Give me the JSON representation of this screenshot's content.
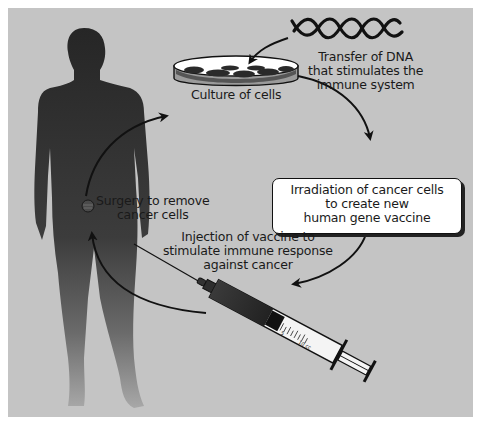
{
  "diagram": {
    "colors": {
      "background": "#c4c4c4",
      "silhouette": "#2e2e2e",
      "arrow": "#111111",
      "box_fill": "#ffffff"
    },
    "labels": {
      "dna": [
        "Transfer of DNA",
        "that stimulates the",
        "immune system"
      ],
      "culture": "Culture of cells",
      "irradiation": [
        "Irradiation of cancer cells",
        "to create new",
        "human gene vaccine"
      ],
      "injection": [
        "Injection of vaccine to",
        "stimulate immune response",
        "against cancer"
      ],
      "surgery": [
        "Surgery to remove",
        "cancer cells"
      ]
    },
    "syringe_scale": [
      "5",
      "10 cc"
    ],
    "steps": [
      "Surgery to remove cancer cells",
      "Culture of cells",
      "Transfer of DNA that stimulates the immune system",
      "Irradiation of cancer cells to create new human gene vaccine",
      "Injection of vaccine to stimulate immune response against cancer"
    ]
  }
}
